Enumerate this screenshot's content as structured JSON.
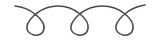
{
  "graphic": {
    "type": "decorative-loop-divider",
    "loop_count": 3,
    "stroke_color": "#4a4a4a",
    "background_color": "#ffffff"
  }
}
